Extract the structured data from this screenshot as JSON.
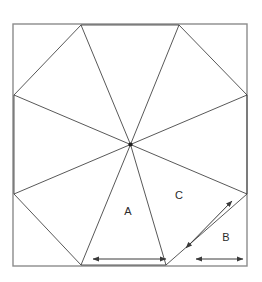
{
  "figure": {
    "background_color": "#ffffff",
    "line_color": "#3a3a3a",
    "border_color": "#8c8c8c",
    "label_color": "#2b2b2b",
    "canvas": {
      "width": 262,
      "height": 282
    }
  },
  "square": {
    "name": "outer-square",
    "left": 13,
    "top": 24,
    "right": 247,
    "bottom": 266,
    "width": 234,
    "height": 242
  },
  "center_point": {
    "label": "center",
    "x": 130.5,
    "y": 144.5
  },
  "boundary_points": [
    {
      "id": "top-left-node",
      "edge": "top",
      "x": 81,
      "y": 25
    },
    {
      "id": "top-right-node",
      "edge": "top",
      "x": 179,
      "y": 25
    },
    {
      "id": "right-upper-node",
      "edge": "right",
      "x": 247,
      "y": 95
    },
    {
      "id": "right-lower-node",
      "edge": "right",
      "x": 247,
      "y": 194
    },
    {
      "id": "bottom-right-node",
      "edge": "bottom",
      "x": 166,
      "y": 265
    },
    {
      "id": "bottom-left-node",
      "edge": "bottom",
      "x": 81,
      "y": 265
    },
    {
      "id": "left-lower-node",
      "edge": "left",
      "x": 14,
      "y": 194
    },
    {
      "id": "left-upper-node",
      "edge": "left",
      "x": 14,
      "y": 95
    }
  ],
  "chords": [
    {
      "id": "chord-top",
      "x1": 81,
      "y1": 25,
      "x2": 179,
      "y2": 25
    },
    {
      "id": "chord-top-right",
      "x1": 179,
      "y1": 25,
      "x2": 247,
      "y2": 95
    },
    {
      "id": "chord-right",
      "x1": 247,
      "y1": 95,
      "x2": 247,
      "y2": 194
    },
    {
      "id": "chord-bottom-right",
      "x1": 247,
      "y1": 194,
      "x2": 166,
      "y2": 265
    },
    {
      "id": "chord-bottom",
      "x1": 166,
      "y1": 265,
      "x2": 81,
      "y2": 265
    },
    {
      "id": "chord-bottom-left",
      "x1": 81,
      "y1": 265,
      "x2": 14,
      "y2": 194
    },
    {
      "id": "chord-left",
      "x1": 14,
      "y1": 194,
      "x2": 14,
      "y2": 95
    },
    {
      "id": "chord-top-left",
      "x1": 14,
      "y1": 95,
      "x2": 81,
      "y2": 25
    }
  ],
  "labels": [
    {
      "id": "label-A",
      "text": "A",
      "x": 128,
      "y": 212
    },
    {
      "id": "label-C",
      "text": "C",
      "x": 179,
      "y": 196
    },
    {
      "id": "label-B",
      "text": "B",
      "x": 226,
      "y": 238
    }
  ],
  "dimension_arrows": [
    {
      "id": "arrow-A",
      "measures": "A",
      "orientation": "horizontal",
      "x1": 93,
      "y1": 259,
      "x2": 166,
      "y2": 259,
      "double_headed": true
    },
    {
      "id": "arrow-B",
      "measures": "B",
      "orientation": "horizontal",
      "x1": 196,
      "y1": 259,
      "x2": 243,
      "y2": 259,
      "double_headed": true
    },
    {
      "id": "arrow-C",
      "measures": "C",
      "orientation": "diagonal",
      "x1": 186,
      "y1": 248,
      "x2": 232,
      "y2": 201,
      "double_headed": true
    }
  ]
}
